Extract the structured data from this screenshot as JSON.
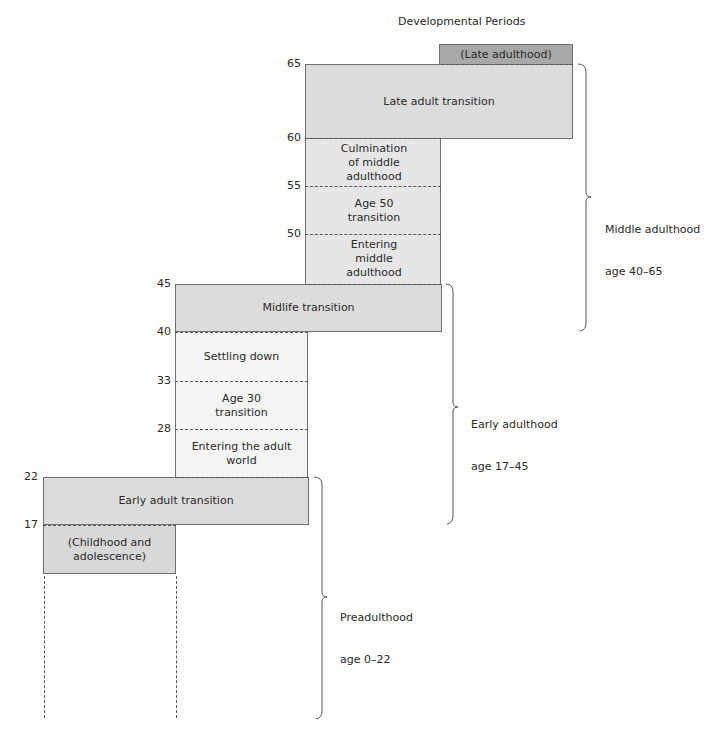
{
  "title": "Developmental Periods",
  "colors": {
    "late_adulthood": "#a8a8a8",
    "transition": "#dcdcdc",
    "middle_stable": "#e6e6e6",
    "early_stable": "#f4f4f4",
    "childhood": "#d8d8d8",
    "line": "#555555"
  },
  "age_ticks": [
    "65",
    "60",
    "55",
    "50",
    "45",
    "40",
    "33",
    "28",
    "22",
    "17"
  ],
  "periods": {
    "late_adulthood": "(Late adulthood)",
    "late_adult_transition": "Late adult transition",
    "culmination": "Culmination of middle adulthood",
    "age50": "Age 50 transition",
    "entering_middle": "Entering middle adulthood",
    "midlife": "Midlife transition",
    "settling": "Settling down",
    "age30": "Age 30 transition",
    "entering_adult": "Entering the adult world",
    "early_adult_transition": "Early adult transition",
    "childhood": "(Childhood and adolescence)"
  },
  "eras": [
    {
      "name": "Middle adulthood",
      "range": "age 40–65"
    },
    {
      "name": "Early adulthood",
      "range": "age 17–45"
    },
    {
      "name": "Preadulthood",
      "range": "age 0–22"
    }
  ]
}
